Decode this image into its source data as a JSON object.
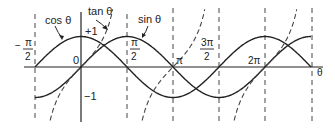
{
  "chart_data": {
    "type": "line",
    "title": "",
    "xlabel": "θ",
    "ylabel": "",
    "x_range": [
      -1.5708,
      7.854
    ],
    "ylim": [
      -1,
      1
    ],
    "grid": false,
    "legend": "inline annotations",
    "x_ticks": [
      {
        "value": -1.5708,
        "label_num": "π",
        "label_den": "2",
        "sign": "−"
      },
      {
        "value": 0,
        "label": "0"
      },
      {
        "value": 1.5708,
        "label_num": "π",
        "label_den": "2"
      },
      {
        "value": 3.1416,
        "label": "π"
      },
      {
        "value": 4.7124,
        "label_num": "3π",
        "label_den": "2"
      },
      {
        "value": 6.2832,
        "label": "2π"
      }
    ],
    "y_ticks": [
      {
        "value": 1,
        "label": "+1"
      },
      {
        "value": -1,
        "label": "−1"
      }
    ],
    "asymptotes": [
      -1.5708,
      1.5708,
      4.7124,
      7.854
    ],
    "gridlines_dashed_at": [
      -1.5708,
      1.5708,
      3.1416,
      4.7124,
      6.2832,
      7.854
    ],
    "series": [
      {
        "name": "cos θ",
        "style": "solid",
        "function": "cos"
      },
      {
        "name": "sin θ",
        "style": "solid",
        "function": "sin"
      },
      {
        "name": "tan θ",
        "style": "dashed",
        "function": "tan"
      }
    ],
    "annotations": [
      "cos θ",
      "tan θ",
      "sin θ"
    ]
  },
  "labels": {
    "cos": "cos θ",
    "tan": "tan θ",
    "sin": "sin θ",
    "plus_one": "+1",
    "minus_one": "−1",
    "zero": "0",
    "neg_pi_over_2_sign": "−",
    "pi": "π",
    "two": "2",
    "three_pi": "3π",
    "pi_label": "π",
    "two_pi": "2π",
    "theta": "θ"
  },
  "colors": {
    "line": "#222222",
    "dash": "#444444"
  }
}
